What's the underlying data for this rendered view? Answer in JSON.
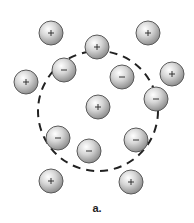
{
  "figure": {
    "label": "a.",
    "boundary": {
      "cx": 98,
      "cy": 111,
      "r": 60,
      "color": "#222222",
      "style": "dashed"
    },
    "ions": [
      {
        "charge": "+",
        "x": 51,
        "y": 33
      },
      {
        "charge": "+",
        "x": 148,
        "y": 33
      },
      {
        "charge": "+",
        "x": 97,
        "y": 47
      },
      {
        "charge": "-",
        "x": 64,
        "y": 70
      },
      {
        "charge": "-",
        "x": 122,
        "y": 77
      },
      {
        "charge": "+",
        "x": 172,
        "y": 74
      },
      {
        "charge": "+",
        "x": 26,
        "y": 82
      },
      {
        "charge": "-",
        "x": 156,
        "y": 99
      },
      {
        "charge": "+",
        "x": 98,
        "y": 107
      },
      {
        "charge": "-",
        "x": 58,
        "y": 138
      },
      {
        "charge": "-",
        "x": 89,
        "y": 151
      },
      {
        "charge": "-",
        "x": 136,
        "y": 140
      },
      {
        "charge": "+",
        "x": 51,
        "y": 181
      },
      {
        "charge": "+",
        "x": 131,
        "y": 182
      }
    ],
    "ion_radius": 12
  }
}
